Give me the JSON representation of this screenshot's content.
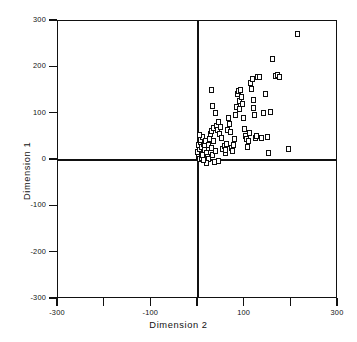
{
  "chart_data": {
    "type": "scatter",
    "title": "",
    "xlabel": "Dimension  2",
    "ylabel": "Dimension  1",
    "xlim": [
      -300,
      300
    ],
    "ylim": [
      -300,
      300
    ],
    "grid": false,
    "legend": null,
    "marker": "open-square",
    "marker_color": "#0d0d0d",
    "marker_fill": "#ffffff",
    "xticks": [
      -300,
      -200,
      -100,
      0,
      100,
      200,
      300
    ],
    "xtick_labels": [
      "-300",
      "",
      "-100",
      "",
      "100",
      "",
      "300"
    ],
    "yticks": [
      300,
      200,
      100,
      0,
      -100,
      -200,
      -300
    ],
    "ytick_labels": [
      "300",
      "200",
      "100",
      "0",
      "-100",
      "-200",
      "-300"
    ],
    "zero_reference_lines": true,
    "n_points": 92,
    "points": [
      [
        3,
        4
      ],
      [
        4,
        10
      ],
      [
        2,
        16
      ],
      [
        5,
        22
      ],
      [
        3,
        30
      ],
      [
        8,
        36
      ],
      [
        6,
        1
      ],
      [
        10,
        2
      ],
      [
        12,
        8
      ],
      [
        9,
        26
      ],
      [
        14,
        33
      ],
      [
        7,
        42
      ],
      [
        11,
        47
      ],
      [
        5,
        52
      ],
      [
        16,
        28
      ],
      [
        18,
        39
      ],
      [
        15,
        20
      ],
      [
        20,
        13
      ],
      [
        22,
        5
      ],
      [
        25,
        0
      ],
      [
        24,
        31
      ],
      [
        27,
        44
      ],
      [
        30,
        24
      ],
      [
        28,
        55
      ],
      [
        32,
        60
      ],
      [
        35,
        38
      ],
      [
        33,
        8
      ],
      [
        38,
        -6
      ],
      [
        40,
        18
      ],
      [
        36,
        66
      ],
      [
        42,
        72
      ],
      [
        44,
        62
      ],
      [
        39,
        99
      ],
      [
        34,
        115
      ],
      [
        30,
        150
      ],
      [
        46,
        80
      ],
      [
        48,
        55
      ],
      [
        50,
        70
      ],
      [
        52,
        46
      ],
      [
        55,
        22
      ],
      [
        58,
        27
      ],
      [
        60,
        12
      ],
      [
        62,
        20
      ],
      [
        64,
        32
      ],
      [
        66,
        63
      ],
      [
        68,
        88
      ],
      [
        70,
        75
      ],
      [
        72,
        58
      ],
      [
        74,
        24
      ],
      [
        76,
        18
      ],
      [
        78,
        30
      ],
      [
        80,
        43
      ],
      [
        82,
        96
      ],
      [
        84,
        112
      ],
      [
        86,
        141
      ],
      [
        88,
        147
      ],
      [
        90,
        108
      ],
      [
        92,
        125
      ],
      [
        94,
        150
      ],
      [
        96,
        133
      ],
      [
        98,
        119
      ],
      [
        100,
        88
      ],
      [
        102,
        64
      ],
      [
        104,
        49
      ],
      [
        106,
        44
      ],
      [
        108,
        26
      ],
      [
        110,
        38
      ],
      [
        112,
        57
      ],
      [
        114,
        165
      ],
      [
        116,
        152
      ],
      [
        118,
        172
      ],
      [
        120,
        128
      ],
      [
        122,
        110
      ],
      [
        124,
        96
      ],
      [
        126,
        46
      ],
      [
        128,
        50
      ],
      [
        130,
        176
      ],
      [
        134,
        178
      ],
      [
        138,
        45
      ],
      [
        142,
        100
      ],
      [
        146,
        140
      ],
      [
        150,
        47
      ],
      [
        154,
        13
      ],
      [
        158,
        101
      ],
      [
        162,
        215
      ],
      [
        168,
        179
      ],
      [
        172,
        181
      ],
      [
        176,
        178
      ],
      [
        196,
        22
      ],
      [
        215,
        270
      ],
      [
        20,
        -9
      ],
      [
        46,
        -5
      ],
      [
        13,
        -3
      ]
    ]
  },
  "axes": {
    "y_title": "Dimension  1",
    "x_title": "Dimension  2"
  }
}
